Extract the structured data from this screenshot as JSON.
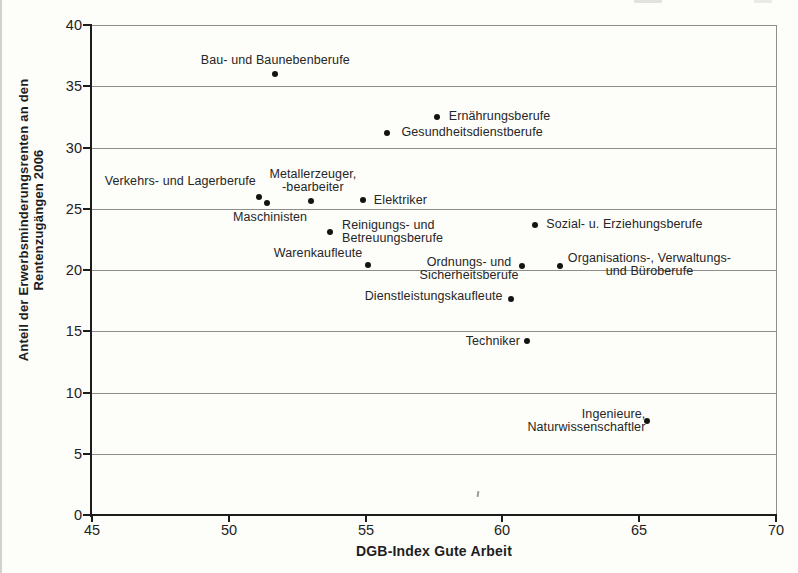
{
  "chart_data": {
    "type": "scatter",
    "title": "",
    "xlabel": "DGB-Index Gute Arbeit",
    "ylabel_lines": [
      "Anteil der Erwerbsminderungsrenten an den",
      "Rentenzugängen 2006"
    ],
    "xlim": [
      45,
      70
    ],
    "ylim": [
      0,
      40
    ],
    "x_ticks": [
      45,
      50,
      55,
      60,
      65,
      70
    ],
    "y_ticks": [
      0,
      5,
      10,
      15,
      20,
      25,
      30,
      35,
      40
    ],
    "grid": "horizontal gridlines at each y tick; plot framed on top and right",
    "legend": "none",
    "marker": "filled black dot",
    "points": [
      {
        "label": "Bau- und Baunebenberufe",
        "x": 51.7,
        "y": 36.0,
        "label_lines": [
          "Bau- und Baunebenberufe"
        ],
        "anchor": "above",
        "dx": 0,
        "dy": 0,
        "align": "center"
      },
      {
        "label": "Ernährungsberufe",
        "x": 57.6,
        "y": 32.5,
        "label_lines": [
          "Ernährungsberufe"
        ],
        "anchor": "right",
        "dx": 12,
        "dy": 0,
        "align": "left"
      },
      {
        "label": "Gesundheitsdienstberufe",
        "x": 55.8,
        "y": 31.2,
        "label_lines": [
          "Gesundheitsdienstberufe"
        ],
        "anchor": "right",
        "dx": 14,
        "dy": 0,
        "align": "left"
      },
      {
        "label": "Verkehrs- und Lagerberufe",
        "x": 51.1,
        "y": 26.0,
        "label_lines": [
          "Verkehrs- und Lagerberufe"
        ],
        "anchor": "left",
        "dx": -3,
        "dy": -15,
        "align": "right"
      },
      {
        "label": "Maschinisten",
        "x": 51.4,
        "y": 25.5,
        "label_lines": [
          "Maschinisten"
        ],
        "anchor": "below",
        "dx": 3,
        "dy": 0,
        "align": "center"
      },
      {
        "label": "Metallerzeuger, -bearbeiter",
        "x": 53.0,
        "y": 25.6,
        "label_lines": [
          "Metallerzeuger,",
          "-bearbeiter"
        ],
        "anchor": "above",
        "dx": 2,
        "dy": 0,
        "align": "center"
      },
      {
        "label": "Elektriker",
        "x": 54.9,
        "y": 25.7,
        "label_lines": [
          "Elektriker"
        ],
        "anchor": "right",
        "dx": 11,
        "dy": 0,
        "align": "left"
      },
      {
        "label": "Reinigungs- und Betreuungsberufe",
        "x": 53.7,
        "y": 23.1,
        "label_lines": [
          "Reinigungs- und",
          "Betreuungsberufe"
        ],
        "anchor": "right",
        "dx": 12,
        "dy": 0,
        "align": "left"
      },
      {
        "label": "Sozial- u. Erziehungsberufe",
        "x": 61.2,
        "y": 23.7,
        "label_lines": [
          "Sozial- u. Erziehungsberufe"
        ],
        "anchor": "right",
        "dx": 11,
        "dy": 0,
        "align": "left"
      },
      {
        "label": "Warenkaufleute",
        "x": 55.1,
        "y": 20.4,
        "label_lines": [
          "Warenkaufleute"
        ],
        "anchor": "left",
        "dx": -6,
        "dy": -12,
        "align": "right"
      },
      {
        "label": "Ordnungs- und Sicherheitsberufe",
        "x": 60.7,
        "y": 20.3,
        "label_lines": [
          "Ordnungs- und",
          "Sicherheitsberufe"
        ],
        "anchor": "left",
        "dx": -3,
        "dy": 3,
        "align": "center"
      },
      {
        "label": "Organisations-, Verwaltungs- und Büroberufe",
        "x": 62.1,
        "y": 20.3,
        "label_lines": [
          "Organisations-, Verwaltungs-",
          "und Büroberufe"
        ],
        "anchor": "right",
        "dx": 8,
        "dy": -1,
        "align": "center"
      },
      {
        "label": "Dienstleistungskaufleute",
        "x": 60.3,
        "y": 17.6,
        "label_lines": [
          "Dienstleistungskaufleute"
        ],
        "anchor": "left",
        "dx": -8,
        "dy": -3,
        "align": "right"
      },
      {
        "label": "Techniker",
        "x": 60.9,
        "y": 14.2,
        "label_lines": [
          "Techniker"
        ],
        "anchor": "left",
        "dx": -7,
        "dy": 0,
        "align": "right"
      },
      {
        "label": "Ingenieure, Naturwissenschaftler",
        "x": 65.3,
        "y": 7.7,
        "label_lines": [
          "Ingenieure,",
          "Naturwissenschaftler"
        ],
        "anchor": "left",
        "dx": -2,
        "dy": 0,
        "align": "right"
      }
    ]
  },
  "colors": {
    "paper": "#fdfdfa",
    "ink": "#1c1c1c",
    "grid": "#8d8d8a",
    "point": "#141414",
    "label": "#262626"
  }
}
